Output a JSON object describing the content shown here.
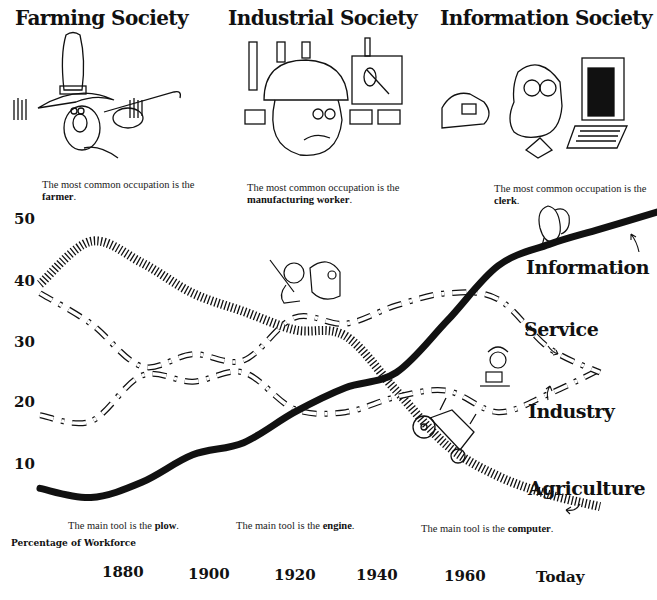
{
  "header": {
    "societies": [
      {
        "title": "Farming Society",
        "caption_prefix": "The most common occupation is the",
        "occupation": "farmer",
        "caption_suffix": "."
      },
      {
        "title": "Industrial Society",
        "caption_prefix": "The most common occupation is the",
        "occupation": "manufacturing worker",
        "caption_suffix": "."
      },
      {
        "title": "Information Society",
        "caption_prefix": "The most common occupation is the",
        "occupation": "clerk",
        "caption_suffix": "."
      }
    ]
  },
  "tools": [
    {
      "prefix": "The main tool is the",
      "tool": "plow",
      "suffix": "."
    },
    {
      "prefix": "The main tool is the",
      "tool": "engine",
      "suffix": "."
    },
    {
      "prefix": "The main tool is the",
      "tool": "computer",
      "suffix": "."
    }
  ],
  "icons": {
    "farmer": "farmer-illustration",
    "factory_worker": "factory-worker-illustration",
    "clerk": "clerk-at-computer-illustration",
    "tractor": "tractor-illustration",
    "service_worker": "service-worker-illustration",
    "miner": "worker-with-engine-illustration",
    "thinker": "person-illustration"
  },
  "colors": {
    "ink": "#111111",
    "background": "#ffffff"
  },
  "chart_data": {
    "type": "line",
    "title": "",
    "xlabel": "",
    "ylabel": "Percentage of Workforce",
    "x_tick_labels": [
      "1880",
      "1900",
      "1920",
      "1940",
      "1960",
      "Today"
    ],
    "y_tick_labels": [
      "50",
      "40",
      "30",
      "20",
      "10"
    ],
    "ylim": [
      0,
      52
    ],
    "grid": false,
    "legend_position": "inline labels at right end of each line",
    "x": [
      1870,
      1880,
      1890,
      1900,
      1910,
      1920,
      1930,
      1940,
      1950,
      1960,
      1970,
      1980
    ],
    "series": [
      {
        "name": "Agriculture",
        "style": "hatched",
        "values": [
          39.5,
          46.5,
          43,
          38,
          35,
          32,
          31,
          22,
          13,
          8,
          5,
          3
        ]
      },
      {
        "name": "Industry",
        "style": "dashed-outline",
        "values": [
          18,
          17,
          24.5,
          23.5,
          25,
          19,
          18.5,
          21,
          22,
          18.5,
          21.5,
          25.5
        ]
      },
      {
        "name": "Service",
        "style": "dashed-outline",
        "values": [
          38,
          33,
          26,
          28,
          27,
          34,
          33,
          36,
          38,
          37,
          29,
          25
        ]
      },
      {
        "name": "Information",
        "style": "solid-thick",
        "values": [
          6,
          4.5,
          7,
          11.5,
          13.5,
          18.5,
          22.5,
          25,
          33.5,
          42.5,
          46,
          48.5
        ]
      }
    ],
    "annotations": [
      "Information",
      "Service",
      "Industry",
      "Agriculture"
    ]
  }
}
